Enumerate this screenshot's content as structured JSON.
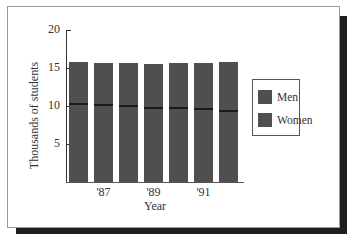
{
  "chart_data": {
    "type": "bar",
    "stacked": true,
    "title": "",
    "xlabel": "Year",
    "ylabel": "Thousands of students",
    "ylim": [
      0,
      20
    ],
    "yticks": [
      5,
      10,
      15,
      20
    ],
    "ytick_labels": [
      "5",
      "10",
      "15",
      "20"
    ],
    "categories": [
      "'86",
      "'87",
      "'88",
      "'89",
      "'90",
      "'91",
      "'92"
    ],
    "xtick_labels_shown": [
      "'87",
      "'89",
      "'91"
    ],
    "totals": [
      15.8,
      15.7,
      15.7,
      15.5,
      15.6,
      15.7,
      15.8
    ],
    "segment_boundary": [
      10.3,
      10.1,
      10.0,
      9.7,
      9.7,
      9.6,
      9.3
    ],
    "series_labels": [
      "Men",
      "Women"
    ],
    "series_to_segment_mapping": "unknown — legend swatches are identical in color, so which segment is Men vs Women cannot be determined from the image",
    "grid": false,
    "legend_position": "right"
  },
  "axis": {
    "y_title": "Thousands of students",
    "x_title": "Year",
    "y_labels": [
      {
        "text": "20",
        "value": 20
      },
      {
        "text": "15",
        "value": 15
      },
      {
        "text": "10",
        "value": 10
      },
      {
        "text": "5",
        "value": 5
      }
    ],
    "x_labels": [
      {
        "text": "'87",
        "index": 1
      },
      {
        "text": "'89",
        "index": 3
      },
      {
        "text": "'91",
        "index": 5
      }
    ]
  },
  "legend": {
    "items": [
      {
        "label": "Men",
        "color": "#4f4f4f"
      },
      {
        "label": "Women",
        "color": "#4f4f4f"
      }
    ]
  },
  "colors": {
    "bar_fill": "#4f4f4f",
    "segment_boundary_line": "#1a1a1a",
    "frame_shadow": "#1e1e1e"
  }
}
